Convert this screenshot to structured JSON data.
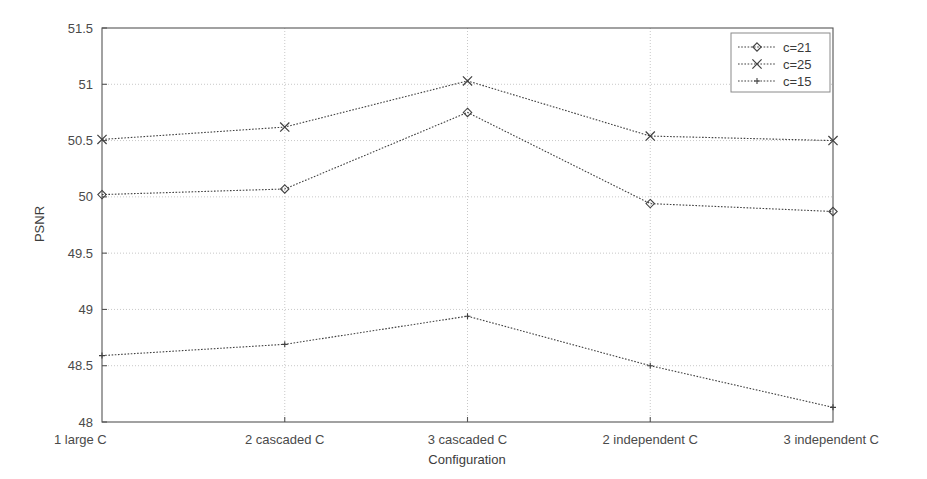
{
  "chart_data": {
    "type": "line",
    "title": "",
    "xlabel": "Configuration",
    "ylabel": "PSNR",
    "categories": [
      "1 large C",
      "2 cascaded C",
      "3 cascaded C",
      "2 independent C",
      "3 independent C"
    ],
    "ylim": [
      48,
      51.5
    ],
    "yticks": [
      48,
      48.5,
      49,
      49.5,
      50,
      50.5,
      51,
      51.5
    ],
    "ytick_labels": [
      "48",
      "48.5",
      "49",
      "49.5",
      "50",
      "50.5",
      "51",
      "51.5"
    ],
    "grid": true,
    "grid_style": "dotted",
    "legend_position": "top-right",
    "series": [
      {
        "name": "c=21",
        "marker": "diamond",
        "color": "#404040",
        "values": [
          50.02,
          50.07,
          50.75,
          49.94,
          49.87
        ]
      },
      {
        "name": "c=25",
        "marker": "x",
        "color": "#404040",
        "values": [
          50.51,
          50.62,
          51.03,
          50.54,
          50.5
        ]
      },
      {
        "name": "c=15",
        "marker": "plus",
        "color": "#404040",
        "values": [
          48.59,
          48.69,
          48.94,
          48.5,
          48.13
        ]
      }
    ]
  },
  "axes": {
    "y_label": "PSNR",
    "x_label": "Configuration",
    "y_tick_0": "48",
    "y_tick_1": "48.5",
    "y_tick_2": "49",
    "y_tick_3": "49.5",
    "y_tick_4": "50",
    "y_tick_5": "50.5",
    "y_tick_6": "51",
    "y_tick_7": "51.5",
    "x_tick_0": "1 large C",
    "x_tick_1": "2 cascaded C",
    "x_tick_2": "3 cascaded C",
    "x_tick_3": "2 independent C",
    "x_tick_4": "3 independent C"
  },
  "legend": {
    "entries": [
      {
        "label": "c=21"
      },
      {
        "label": "c=25"
      },
      {
        "label": "c=15"
      }
    ]
  },
  "style": {
    "axis_color": "#555555",
    "grid_color": "#c8c8c8",
    "line_color": "#404040",
    "background": "#ffffff"
  }
}
